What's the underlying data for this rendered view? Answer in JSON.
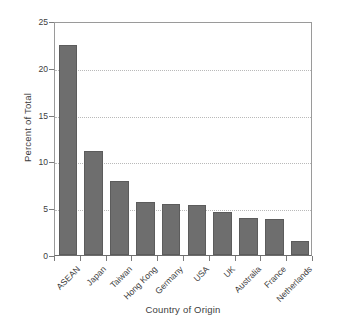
{
  "chart_data": {
    "type": "bar",
    "title": "",
    "xlabel": "Country of Origin",
    "ylabel": "Percent of Total",
    "categories": [
      "ASEAN",
      "Japan",
      "Taiwan",
      "Hong Kong",
      "Germany",
      "USA",
      "UK",
      "Australia",
      "France",
      "Netherlands"
    ],
    "values": [
      22.4,
      11.1,
      7.9,
      5.7,
      5.4,
      5.3,
      4.6,
      4.0,
      3.8,
      1.5
    ],
    "ylim": [
      0,
      25
    ],
    "yticks": [
      0,
      5,
      10,
      15,
      20,
      25
    ],
    "ytick_labels": [
      "0",
      "5",
      "10",
      "15",
      "20",
      "25"
    ],
    "grid": true,
    "grid_axis": "y",
    "legend": "none",
    "bar_color": "#6e6e6e",
    "axis_color": "#7c7c7c",
    "grid_color": "#b9b9b9",
    "background": "#ffffff",
    "xtick_label_rotation": -45
  }
}
